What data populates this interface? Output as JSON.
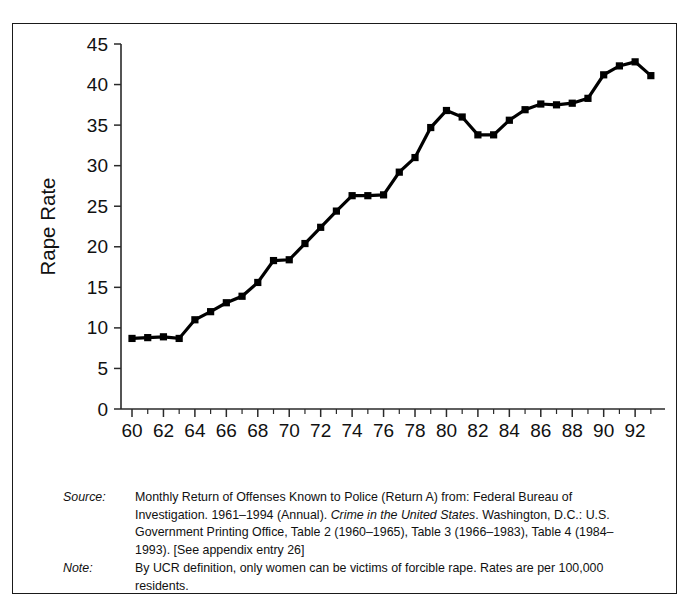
{
  "figure": {
    "border_color": "#1a1a1a",
    "background": "#ffffff"
  },
  "chart_data": {
    "type": "line",
    "title": "",
    "xlabel": "Year",
    "ylabel": "Rape Rate",
    "xlim": [
      59.3,
      93.9
    ],
    "ylim": [
      0,
      45
    ],
    "grid": false,
    "legend": null,
    "marker": "filled-square",
    "line_color": "#000000",
    "x_tick_labels": [
      "60",
      "62",
      "64",
      "66",
      "68",
      "70",
      "72",
      "74",
      "76",
      "78",
      "80",
      "82",
      "84",
      "86",
      "88",
      "90",
      "92"
    ],
    "x_tick_values": [
      60,
      62,
      64,
      66,
      68,
      70,
      72,
      74,
      76,
      78,
      80,
      82,
      84,
      86,
      88,
      90,
      92
    ],
    "x_minor_values": [
      61,
      63,
      65,
      67,
      69,
      71,
      73,
      75,
      77,
      79,
      81,
      83,
      85,
      87,
      89,
      91,
      93
    ],
    "y_tick_labels": [
      "0",
      "5",
      "10",
      "15",
      "20",
      "25",
      "30",
      "35",
      "40",
      "45"
    ],
    "y_tick_values": [
      0,
      5,
      10,
      15,
      20,
      25,
      30,
      35,
      40,
      45
    ],
    "x": [
      60,
      61,
      62,
      63,
      64,
      65,
      66,
      67,
      68,
      69,
      70,
      71,
      72,
      73,
      74,
      75,
      76,
      77,
      78,
      79,
      80,
      81,
      82,
      83,
      84,
      85,
      86,
      87,
      88,
      89,
      90,
      91,
      92,
      93
    ],
    "values": [
      8.7,
      8.8,
      8.9,
      8.7,
      11.0,
      12.0,
      13.1,
      13.9,
      15.6,
      18.3,
      18.4,
      20.4,
      22.4,
      24.4,
      26.3,
      26.3,
      26.4,
      29.2,
      31.0,
      34.7,
      36.8,
      36.0,
      33.8,
      33.8,
      35.6,
      36.9,
      37.6,
      37.5,
      37.7,
      38.3,
      41.2,
      42.3,
      42.8,
      41.1
    ],
    "series_name": "Rape Rate per 100,000 residents"
  },
  "notes": {
    "source_label": "Source:",
    "source_text_1": "Monthly Return of Offenses Known to Police (Return A) from:  Federal Bureau of Investigation. 1961–1994 (Annual). ",
    "source_title_italic": "Crime in the United States",
    "source_text_2": ". Washington, D.C.: U.S. Government Printing Office, Table 2 (1960–1965), Table 3 (1966–1983), Table 4 (1984–1993). [See appendix entry 26]",
    "note_label": "Note:",
    "note_text": "By UCR definition, only women can be victims of forcible rape.  Rates are per 100,000 residents."
  }
}
